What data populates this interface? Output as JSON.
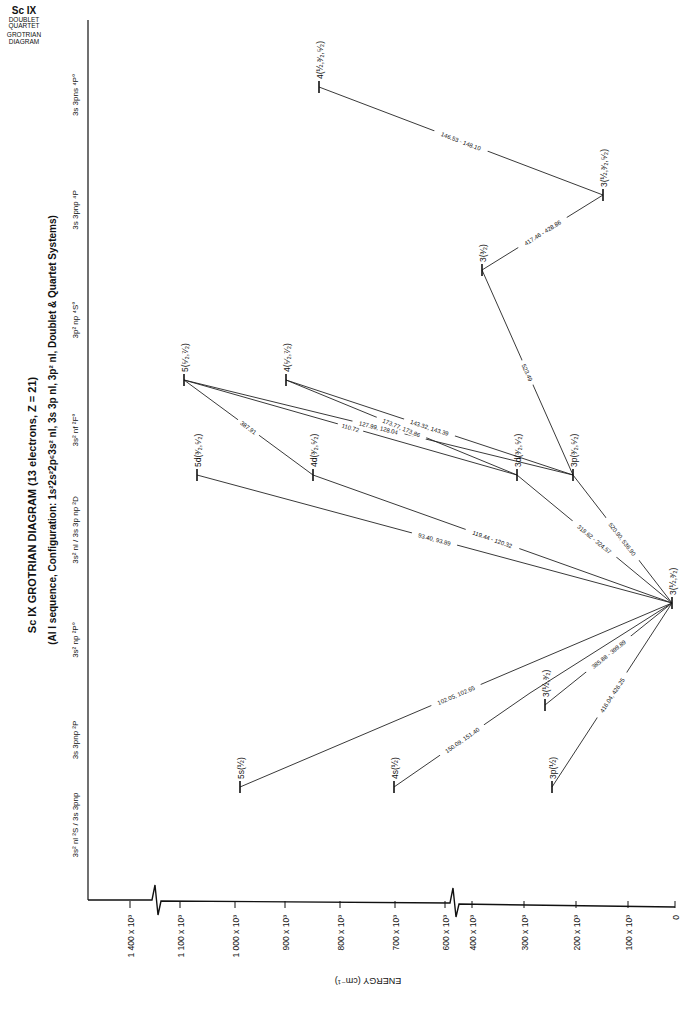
{
  "corner": {
    "title": "Sc IX",
    "line1": "DOUBLET",
    "line2": "QUARTET",
    "line3": "GROTRIAN",
    "line4": "DIAGRAM"
  },
  "title": {
    "main": "Sc IX  GROTRIAN  DIAGRAM  (13  electrons,  Z = 21)",
    "sub": "(Al I sequence,  Configuration: 1s²2s²2p⁶3s² nl, 3s 3p nl, 3p² nl,  Doublet & Quartet  Systems)"
  },
  "columns": [
    {
      "label": "3s² nl ²S / 3s 3pnp",
      "x": 825
    },
    {
      "label": "3s 3pnp ²P",
      "x": 740
    },
    {
      "label": "3s² np ²P°",
      "x": 640
    },
    {
      "label": "3s² nl / 3s 3p np ²D",
      "x": 530
    },
    {
      "label": "3s² nf  ²F°",
      "x": 430
    },
    {
      "label": "3p² np ⁴S°",
      "x": 320
    },
    {
      "label": "3s 3pnp ⁴P",
      "x": 210
    },
    {
      "label": "3s 3pns ⁴P°",
      "x": 95
    }
  ],
  "axis": {
    "label": "ENERGY (cm⁻¹)",
    "ticks": [
      {
        "label": "1 400 x 10³",
        "y": 130
      },
      {
        "label": "1 100 x 10³",
        "y": 180
      },
      {
        "label": "1 000 x 10³",
        "y": 235
      },
      {
        "label": "900 x 10³",
        "y": 285
      },
      {
        "label": "800 x 10³",
        "y": 340
      },
      {
        "label": "700 x 10³",
        "y": 395
      },
      {
        "label": "600 x 10³",
        "y": 445
      },
      {
        "label": "400 x 10³",
        "y": 472
      },
      {
        "label": "300 x 10³",
        "y": 524
      },
      {
        "label": "200 x 10³",
        "y": 576
      },
      {
        "label": "100 x 10³",
        "y": 628
      },
      {
        "label": "0",
        "y": 675
      }
    ]
  },
  "levels": [
    {
      "id": "g",
      "label": "3(½,³⁄₂)",
      "x": 603,
      "y": 672
    },
    {
      "id": "5s",
      "label": "5s(½)",
      "x": 787,
      "y": 240
    },
    {
      "id": "4s",
      "label": "4s(½)",
      "x": 787,
      "y": 394
    },
    {
      "id": "3p",
      "label": "3p(½)",
      "x": 787,
      "y": 552
    },
    {
      "id": "3pnp2P",
      "label": "3(½,³⁄₂)",
      "x": 705,
      "y": 545
    },
    {
      "id": "5d",
      "label": "5d(³⁄₂,⁵⁄₂)",
      "x": 475,
      "y": 197
    },
    {
      "id": "4d",
      "label": "4d(³⁄₂,⁵⁄₂)",
      "x": 475,
      "y": 313
    },
    {
      "id": "3d",
      "label": "3d(³⁄₂,⁵⁄₂)",
      "x": 475,
      "y": 517
    },
    {
      "id": "3p2D",
      "label": "3p(³⁄₂,⁵⁄₂)",
      "x": 475,
      "y": 573
    },
    {
      "id": "5f",
      "label": "5(⁵⁄₂,⁷⁄₂)",
      "x": 380,
      "y": 184
    },
    {
      "id": "4f",
      "label": "4(⁵⁄₂,⁷⁄₂)",
      "x": 380,
      "y": 286
    },
    {
      "id": "4S",
      "label": "3(³⁄₂)",
      "x": 270,
      "y": 482
    },
    {
      "id": "4P",
      "label": "3(½,³⁄₂,⁵⁄₂)",
      "x": 195,
      "y": 603
    },
    {
      "id": "4Po",
      "label": "4(½,³⁄₂,⁵⁄₂)",
      "x": 87,
      "y": 319
    }
  ],
  "transitions": [
    {
      "from": "g",
      "to": "5s",
      "label": "102.05, 102.65"
    },
    {
      "from": "g",
      "to": "4s",
      "label": "150.09, 151.40",
      "bend": [
        693,
        530
      ]
    },
    {
      "from": "g",
      "to": "3p",
      "label": "416.04, 426.25"
    },
    {
      "from": "g",
      "to": "3pnp2P",
      "label": "385.88 - 399.89"
    },
    {
      "from": "g",
      "to": "5d",
      "label": "93.40, 93.89"
    },
    {
      "from": "g",
      "to": "4d",
      "label": "119.44 - 120.32"
    },
    {
      "from": "g",
      "to": "3d",
      "label": "318.62 - 324.57"
    },
    {
      "from": "g",
      "to": "3p2D",
      "label": "520.90, 536.90"
    },
    {
      "from": "5f",
      "to": "4d",
      "label": "387.91"
    },
    {
      "from": "5f",
      "to": "3d",
      "label": "110.72"
    },
    {
      "from": "5f",
      "to": "3p2D",
      "label": "127.99, 128.04"
    },
    {
      "from": "4f",
      "to": "3d",
      "label": "173.77, 173.86"
    },
    {
      "from": "4f",
      "to": "3p2D",
      "label": "143.32, 143.39"
    },
    {
      "from": "4S",
      "to": "3p2D",
      "label": "523.49"
    },
    {
      "from": "4S",
      "to": "4P",
      "label": "417.46 - 428.86"
    },
    {
      "from": "4P",
      "to": "4Po",
      "label": "146.53 - 148.10"
    }
  ]
}
